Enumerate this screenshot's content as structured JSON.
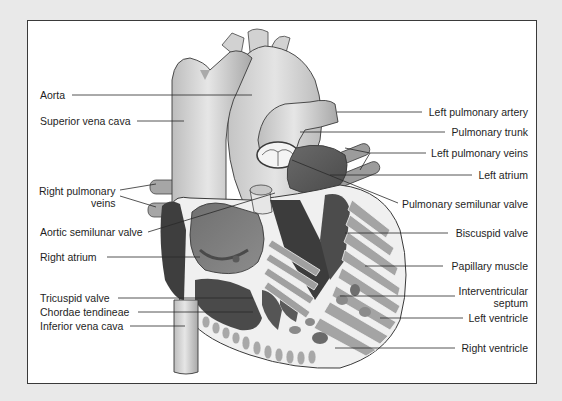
{
  "diagram": {
    "labels_left": [
      {
        "id": "aorta",
        "text": "Aorta"
      },
      {
        "id": "superior-vena-cava",
        "text": "Superior vena cava"
      },
      {
        "id": "right-pulmonary-veins",
        "text": "Right pulmonary",
        "text2": "veins"
      },
      {
        "id": "aortic-semilunar-valve",
        "text": "Aortic semilunar valve"
      },
      {
        "id": "right-atrium",
        "text": "Right atrium"
      },
      {
        "id": "tricuspid-valve",
        "text": "Tricuspid valve"
      },
      {
        "id": "chordae-tendineae",
        "text": "Chordae tendineae"
      },
      {
        "id": "inferior-vena-cava",
        "text": "Inferior vena cava"
      }
    ],
    "labels_right": [
      {
        "id": "left-pulmonary-artery",
        "text": "Left pulmonary artery"
      },
      {
        "id": "pulmonary-trunk",
        "text": "Pulmonary trunk"
      },
      {
        "id": "left-pulmonary-veins",
        "text": "Left pulmonary veins"
      },
      {
        "id": "left-atrium",
        "text": "Left atrium"
      },
      {
        "id": "pulmonary-semilunar-valve",
        "text": "Pulmonary semilunar valve"
      },
      {
        "id": "biscuspid-valve",
        "text": "Biscuspid valve"
      },
      {
        "id": "papillary-muscle",
        "text": "Papillary muscle"
      },
      {
        "id": "interventricular-septum",
        "text": "Interventricular",
        "text2": "septum"
      },
      {
        "id": "left-ventricle",
        "text": "Left ventricle"
      },
      {
        "id": "right-ventricle",
        "text": "Right ventricle"
      }
    ]
  },
  "colors": {
    "page_bg": "#e9e9e9",
    "frame_bg": "#ffffff",
    "vessel_light": "#d8d8d8",
    "vessel_mid": "#b0b0b0",
    "chamber_dark": "#555555",
    "muscle": "#9a9a9a",
    "outline": "#3a3a3a",
    "text": "#1e1e1e"
  }
}
